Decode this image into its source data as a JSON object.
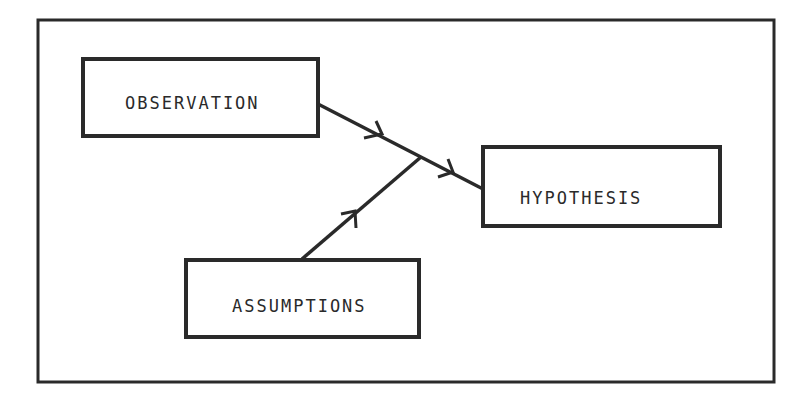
{
  "diagram": {
    "type": "flow",
    "stroke_color": "#2a2a2a",
    "background": "#ffffff",
    "nodes": [
      {
        "id": "observation",
        "label": "OBSERVATION"
      },
      {
        "id": "assumptions",
        "label": "ASSUMPTIONS"
      },
      {
        "id": "hypothesis",
        "label": "HYPOTHESIS"
      }
    ],
    "edges": [
      {
        "from": "observation",
        "to": "hypothesis"
      },
      {
        "from": "assumptions",
        "to": "hypothesis",
        "merges_into": "observation-hypothesis"
      }
    ]
  }
}
